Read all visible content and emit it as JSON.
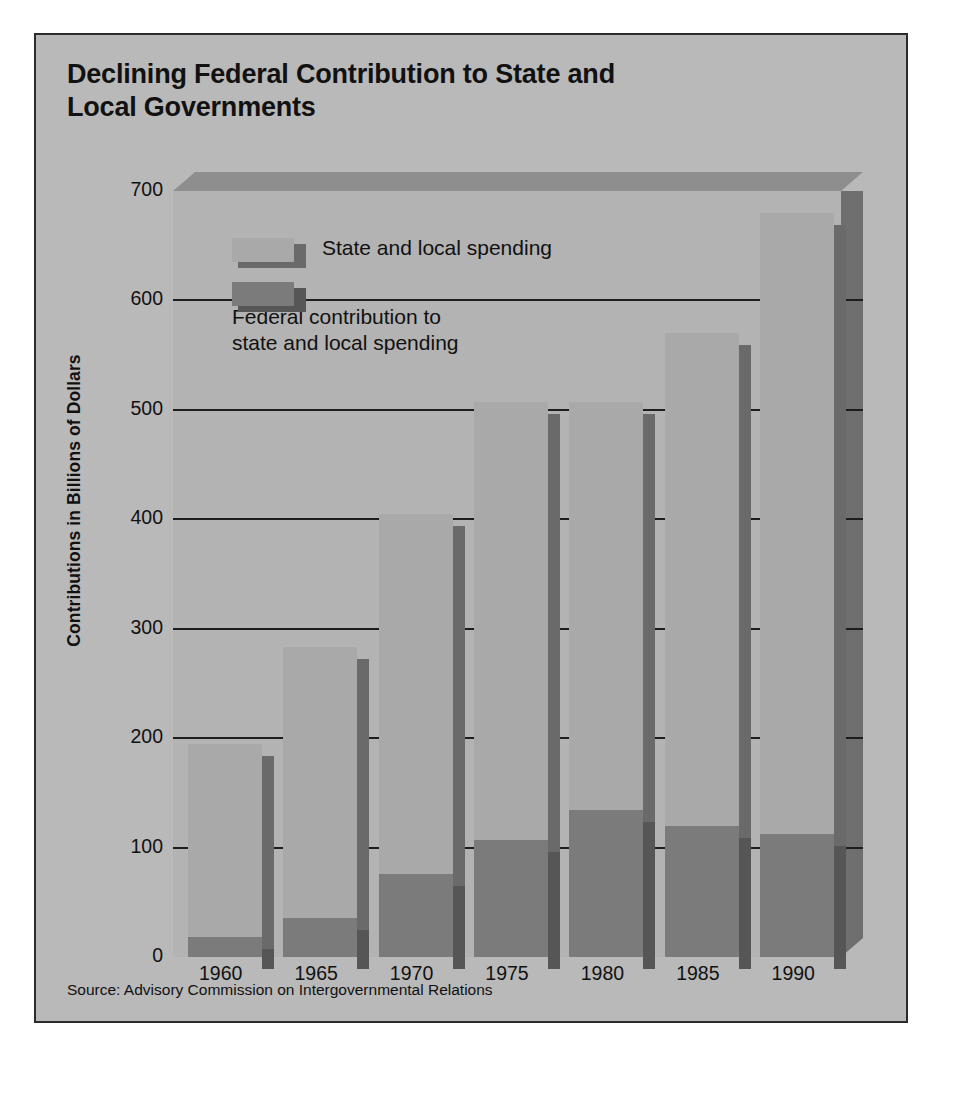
{
  "chart_data": {
    "type": "bar",
    "title": "Declining Federal Contribution to State and Local Governments",
    "xlabel": "",
    "ylabel": "Contributions in Billions of Dollars",
    "ylim": [
      0,
      700
    ],
    "yticks": [
      700,
      600,
      500,
      400,
      300,
      200,
      100,
      0
    ],
    "grid": true,
    "legend_position": "inside-top-left",
    "categories": [
      "1960",
      "1965",
      "1970",
      "1975",
      "1980",
      "1985",
      "1990"
    ],
    "series": [
      {
        "name": "State and local spending",
        "color": "#a9a9a9",
        "values": [
          195,
          283,
          405,
          507,
          507,
          570,
          680
        ]
      },
      {
        "name": "Federal contribution to state and local spending",
        "color": "#7b7b7b",
        "values": [
          18,
          36,
          76,
          107,
          134,
          120,
          112
        ]
      }
    ],
    "source": "Source: Advisory Commission on Intergovernmental Relations"
  },
  "figure": {
    "title_line1": "Declining Federal Contribution to State and",
    "title_line2": "Local Governments",
    "ylabel": "Contributions in Billions of Dollars",
    "source": "Source: Advisory Commission on Intergovernmental Relations",
    "legend": [
      {
        "label": "State and local spending",
        "color": "#a9a9a9",
        "shadow": "#6a6a6a"
      },
      {
        "label": "Federal contribution to\nstate and local spending",
        "color": "#7b7b7b",
        "shadow": "#565656"
      }
    ],
    "colors": {
      "card_background": "#b9b9b9",
      "plot_background": "#b3b3b3",
      "plot_top": "#8e8e8e",
      "plot_right_wall": "#6f6f6f",
      "frame": "#2b2b2b",
      "gridline": "#1d1d1d",
      "text": "#111111"
    }
  }
}
